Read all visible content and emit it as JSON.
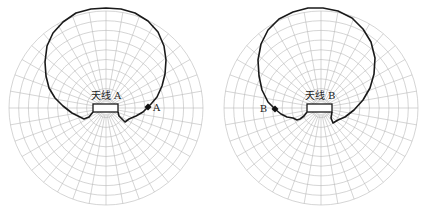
{
  "figure": {
    "width": 423,
    "height": 213,
    "background": "#ffffff",
    "grid_color": "#b8b8b8",
    "curve_color": "#1a1a1a",
    "panels": [
      {
        "id": "A",
        "antenna_label": "天线 A",
        "point_label": "A",
        "center": [
          106,
          108
        ],
        "radius": 97,
        "rings": 10,
        "spokes": 36,
        "box": {
          "x": 93,
          "y": 104,
          "w": 25,
          "h": 8
        },
        "label_pos": [
          106,
          99
        ],
        "point": [
          148,
          107
        ],
        "point_label_pos": [
          153,
          111
        ],
        "curve": "M 93 112 L 89 117 L 84 119 L 80 117 L 72 113 L 63 106 L 55 98 L 49 88 L 46 76 L 45 62 L 47 46 L 53 33 L 63 22 L 76 13 L 91 9 L 106 8 L 121 9 L 135 13 L 148 21 L 158 32 L 164 46 L 166 60 L 165 74 L 162 86 L 157 97 L 151 104 L 148 107 L 143 112 L 136 116 L 129 119 L 125 122 L 122 119 L 119 116 L 118 112"
      },
      {
        "id": "B",
        "antenna_label": "天线 B",
        "point_label": "B",
        "center": [
          321,
          108
        ],
        "radius": 97,
        "rings": 10,
        "spokes": 36,
        "box": {
          "x": 307,
          "y": 104,
          "w": 25,
          "h": 8
        },
        "label_pos": [
          320,
          99
        ],
        "point": [
          275,
          109
        ],
        "point_label_pos": [
          267,
          112
        ],
        "curve": "M 307 112 L 304 116 L 300 119 L 297 120 L 293 118 L 287 117 L 281 114 L 275 109 L 268 102 L 262 90 L 259 76 L 258 60 L 261 44 L 268 30 L 279 19 L 293 12 L 308 8 L 323 8 L 338 11 L 352 18 L 363 29 L 371 42 L 375 58 L 374 74 L 370 88 L 363 100 L 354 110 L 345 117 L 338 120 L 333 123 L 331 118 L 332 112"
      }
    ]
  }
}
